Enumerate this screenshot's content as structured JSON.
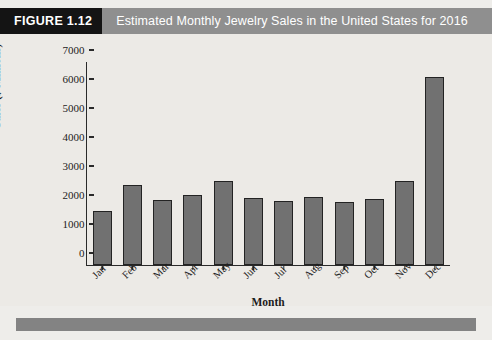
{
  "figure": {
    "tag": "FIGURE 1.12",
    "title": "Estimated Monthly Jewelry Sales in the United States for 2016"
  },
  "colors": {
    "header_band": "#8f8f8f",
    "figure_tag_bg": "#141414",
    "bar_fill": "#717171",
    "bar_edge": "#232323",
    "plot_bg": "#eceae6",
    "footer_band": "#838383"
  },
  "chart_data": {
    "type": "bar",
    "title": "Estimated Monthly Jewelry Sales in the United States for 2016",
    "xlabel": "Month",
    "ylabel": "Sales ($ Millions)",
    "categories": [
      "Jan",
      "Feb",
      "Mar",
      "Apr",
      "May",
      "Jun",
      "Jul",
      "Aug",
      "Sep",
      "Oct",
      "Nov",
      "Dec"
    ],
    "values": [
      1850,
      2750,
      2250,
      2400,
      2900,
      2320,
      2220,
      2330,
      2170,
      2270,
      2880,
      6500
    ],
    "ylim": [
      0,
      7000
    ],
    "yticks": [
      0,
      1000,
      2000,
      3000,
      4000,
      5000,
      6000,
      7000
    ],
    "ytick_labels": [
      "0",
      "1000",
      "2000",
      "3000",
      "4000",
      "5000",
      "6000",
      "7000"
    ],
    "grid": false,
    "legend": false
  }
}
